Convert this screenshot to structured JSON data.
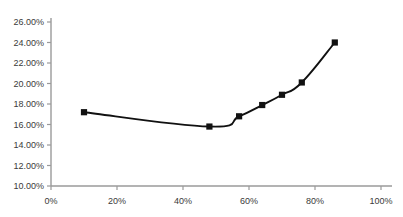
{
  "chart_data": {
    "type": "line",
    "title": "",
    "subtitle": "",
    "xlabel": "",
    "ylabel": "",
    "xlim": [
      0,
      100
    ],
    "ylim": [
      10,
      26
    ],
    "grid": false,
    "legend": null,
    "legend_position": "none",
    "x_tick_labels": [
      "0%",
      "20%",
      "40%",
      "60%",
      "80%",
      "100%"
    ],
    "x_ticks": [
      0,
      20,
      40,
      60,
      80,
      100
    ],
    "y_tick_labels": [
      "10.00%",
      "12.00%",
      "14.00%",
      "16.00%",
      "18.00%",
      "20.00%",
      "22.00%",
      "24.00%",
      "26.00%"
    ],
    "y_ticks": [
      10,
      12,
      14,
      16,
      18,
      20,
      22,
      24,
      26
    ],
    "series": [
      {
        "name": "",
        "marker": "square",
        "marker_color": "#111111",
        "line_color": "#111111",
        "x": [
          10,
          48,
          57,
          64,
          70,
          76,
          86
        ],
        "values": [
          17.2,
          15.8,
          16.8,
          17.9,
          18.9,
          20.1,
          24.0
        ],
        "points": [
          {
            "x": 10,
            "y": 17.2
          },
          {
            "x": 48,
            "y": 15.8
          },
          {
            "x": 57,
            "y": 16.8
          },
          {
            "x": 64,
            "y": 17.9
          },
          {
            "x": 70,
            "y": 18.9
          },
          {
            "x": 76,
            "y": 20.1
          },
          {
            "x": 86,
            "y": 24.0
          }
        ]
      }
    ],
    "colors": {
      "line": "#111111",
      "marker": "#111111",
      "axis": "#9a9a9a",
      "tick_text": "#3a3a3a",
      "background": "#ffffff"
    }
  }
}
